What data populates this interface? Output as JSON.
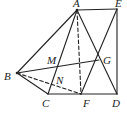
{
  "figure": {
    "type": "geometry",
    "stroke_color": "#222222",
    "points": {
      "A": {
        "x": 77,
        "y": 10
      },
      "E": {
        "x": 117,
        "y": 9
      },
      "B": {
        "x": 17,
        "y": 73
      },
      "C": {
        "x": 48,
        "y": 94
      },
      "F": {
        "x": 81,
        "y": 94
      },
      "D": {
        "x": 117,
        "y": 94
      },
      "M": {
        "x": 57,
        "y": 67
      },
      "G": {
        "x": 99,
        "y": 60
      },
      "N": {
        "x": 53,
        "y": 82
      }
    },
    "labels": [
      {
        "name": "A",
        "x": 73,
        "y": 7
      },
      {
        "name": "E",
        "x": 115,
        "y": 7
      },
      {
        "name": "B",
        "x": 4,
        "y": 80
      },
      {
        "name": "M",
        "x": 47,
        "y": 64
      },
      {
        "name": "G",
        "x": 103,
        "y": 64
      },
      {
        "name": "N",
        "x": 56,
        "y": 84
      },
      {
        "name": "C",
        "x": 42,
        "y": 107
      },
      {
        "name": "F",
        "x": 83,
        "y": 107
      },
      {
        "name": "D",
        "x": 112,
        "y": 107
      }
    ],
    "solid_segments": [
      [
        "A",
        "E"
      ],
      [
        "E",
        "D"
      ],
      [
        "C",
        "D"
      ],
      [
        "A",
        "B"
      ],
      [
        "B",
        "C"
      ],
      [
        "A",
        "C"
      ],
      [
        "A",
        "D"
      ],
      [
        "B",
        "G"
      ],
      [
        "F",
        "E"
      ]
    ],
    "dashed_segments": [
      [
        "A",
        "F"
      ],
      [
        "B",
        "F"
      ]
    ]
  }
}
